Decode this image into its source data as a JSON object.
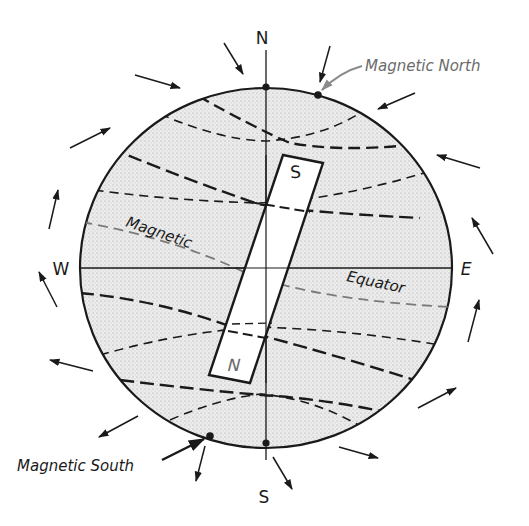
{
  "diagram": {
    "compass": {
      "north": "N",
      "south": "S",
      "west": "W",
      "east": "E"
    },
    "magnet": {
      "top_pole": "S",
      "bottom_pole": "N"
    },
    "labels": {
      "magnetic_north": "Magnetic North",
      "magnetic_south": "Magnetic South",
      "magnetic_equator_line1": "Magnetic",
      "magnetic_equator_line2": "Equator"
    },
    "colors": {
      "ink": "#1a1a1a",
      "globe_fill": "#e4e4e4",
      "magnetic_equator": "#7a7a7a",
      "label_grey": "#6b6b6b",
      "background": "#ffffff"
    }
  }
}
